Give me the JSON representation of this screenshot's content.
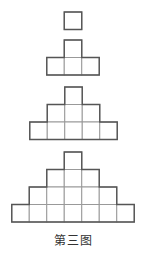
{
  "diagram": {
    "caption": "第三图",
    "cell_size": 17.5,
    "stroke_color": "#555555",
    "inner_color": "#999999",
    "figures": [
      {
        "name": "figure-1",
        "top": 12,
        "center_x": 73,
        "rows": [
          1
        ]
      },
      {
        "name": "figure-2",
        "top": 40,
        "center_x": 73,
        "rows": [
          1,
          3
        ]
      },
      {
        "name": "figure-3",
        "top": 87,
        "center_x": 73.5,
        "rows": [
          1,
          3,
          5
        ]
      },
      {
        "name": "figure-4",
        "top": 152,
        "center_x": 73,
        "rows": [
          1,
          3,
          5,
          7
        ]
      }
    ]
  }
}
